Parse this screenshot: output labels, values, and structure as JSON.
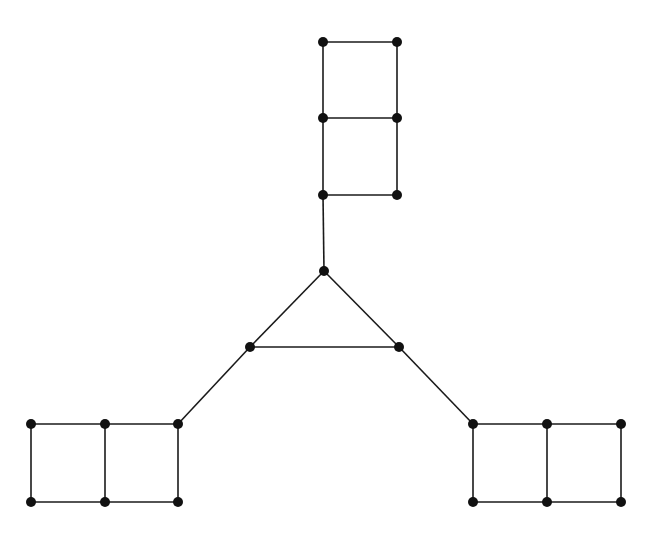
{
  "diagram": {
    "type": "graph",
    "node_color": "#111111",
    "edge_color": "#1a1a1a",
    "node_radius": 5,
    "nodes": [
      {
        "id": "t1",
        "x": 324,
        "y": 271
      },
      {
        "id": "t2",
        "x": 250,
        "y": 347
      },
      {
        "id": "t3",
        "x": 399,
        "y": 347
      },
      {
        "id": "u1",
        "x": 323,
        "y": 42
      },
      {
        "id": "u2",
        "x": 397,
        "y": 42
      },
      {
        "id": "u3",
        "x": 323,
        "y": 118
      },
      {
        "id": "u4",
        "x": 397,
        "y": 118
      },
      {
        "id": "u5",
        "x": 323,
        "y": 195
      },
      {
        "id": "u6",
        "x": 397,
        "y": 195
      },
      {
        "id": "l1",
        "x": 31,
        "y": 424
      },
      {
        "id": "l2",
        "x": 105,
        "y": 424
      },
      {
        "id": "l3",
        "x": 178,
        "y": 424
      },
      {
        "id": "l4",
        "x": 31,
        "y": 502
      },
      {
        "id": "l5",
        "x": 105,
        "y": 502
      },
      {
        "id": "l6",
        "x": 178,
        "y": 502
      },
      {
        "id": "r1",
        "x": 473,
        "y": 424
      },
      {
        "id": "r2",
        "x": 547,
        "y": 424
      },
      {
        "id": "r3",
        "x": 621,
        "y": 424
      },
      {
        "id": "r4",
        "x": 473,
        "y": 502
      },
      {
        "id": "r5",
        "x": 547,
        "y": 502
      },
      {
        "id": "r6",
        "x": 621,
        "y": 502
      }
    ],
    "edges": [
      [
        "t1",
        "t2"
      ],
      [
        "t1",
        "t3"
      ],
      [
        "t2",
        "t3"
      ],
      [
        "t1",
        "u5"
      ],
      [
        "u1",
        "u2"
      ],
      [
        "u3",
        "u4"
      ],
      [
        "u5",
        "u6"
      ],
      [
        "u1",
        "u3"
      ],
      [
        "u3",
        "u5"
      ],
      [
        "u2",
        "u4"
      ],
      [
        "u4",
        "u6"
      ],
      [
        "t2",
        "l3"
      ],
      [
        "l1",
        "l2"
      ],
      [
        "l2",
        "l3"
      ],
      [
        "l4",
        "l5"
      ],
      [
        "l5",
        "l6"
      ],
      [
        "l1",
        "l4"
      ],
      [
        "l2",
        "l5"
      ],
      [
        "l3",
        "l6"
      ],
      [
        "t3",
        "r1"
      ],
      [
        "r1",
        "r2"
      ],
      [
        "r2",
        "r3"
      ],
      [
        "r4",
        "r5"
      ],
      [
        "r5",
        "r6"
      ],
      [
        "r1",
        "r4"
      ],
      [
        "r2",
        "r5"
      ],
      [
        "r3",
        "r6"
      ]
    ]
  }
}
